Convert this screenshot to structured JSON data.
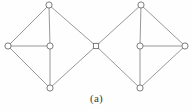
{
  "figure": {
    "caption": "(a)",
    "label": "two-diamond-graph",
    "colors": {
      "background": "#fefefe",
      "edge": "#8c8c8c",
      "node_stroke": "#6e6e6e",
      "node_fill": "#ffffff",
      "caption_text": "#3a3a3a"
    },
    "style": {
      "edge_width": 0.9,
      "node_radius": 3.1,
      "node_stroke_width": 0.9,
      "junction_size": 5.2
    }
  },
  "graph": {
    "type": "node-link-diagram",
    "description": "Two rhombus (diamond) subgraphs joined at a shared square articulation vertex",
    "nodes": [
      {
        "id": "L-top",
        "name": "left-top-node",
        "shape": "circle",
        "x": 49,
        "y": 5
      },
      {
        "id": "L-left",
        "name": "left-left-node",
        "shape": "circle",
        "x": 8,
        "y": 46
      },
      {
        "id": "L-center",
        "name": "left-center-node",
        "shape": "circle",
        "x": 50,
        "y": 46
      },
      {
        "id": "L-bottom",
        "name": "left-bottom-node",
        "shape": "circle",
        "x": 50,
        "y": 88
      },
      {
        "id": "J-center",
        "name": "shared-junction-node",
        "shape": "square",
        "x": 96,
        "y": 46
      },
      {
        "id": "R-top",
        "name": "right-top-node",
        "shape": "circle",
        "x": 141,
        "y": 5
      },
      {
        "id": "R-center",
        "name": "right-center-node",
        "shape": "circle",
        "x": 140,
        "y": 46
      },
      {
        "id": "R-bottom",
        "name": "right-bottom-node",
        "shape": "circle",
        "x": 140,
        "y": 88
      },
      {
        "id": "R-right",
        "name": "right-right-node",
        "shape": "circle",
        "x": 185,
        "y": 46
      }
    ],
    "edges": [
      {
        "from": "L-left",
        "to": "L-top",
        "name": "edge-left-left-to-left-top"
      },
      {
        "from": "L-left",
        "to": "L-center",
        "name": "edge-left-left-to-left-center"
      },
      {
        "from": "L-left",
        "to": "L-bottom",
        "name": "edge-left-left-to-left-bottom"
      },
      {
        "from": "L-top",
        "to": "L-center",
        "name": "edge-left-top-to-left-center"
      },
      {
        "from": "L-top",
        "to": "J-center",
        "name": "edge-left-top-to-junction"
      },
      {
        "from": "L-center",
        "to": "L-bottom",
        "name": "edge-left-center-to-left-bottom"
      },
      {
        "from": "L-bottom",
        "to": "J-center",
        "name": "edge-left-bottom-to-junction"
      },
      {
        "from": "J-center",
        "to": "R-top",
        "name": "edge-junction-to-right-top"
      },
      {
        "from": "J-center",
        "to": "R-bottom",
        "name": "edge-junction-to-right-bottom"
      },
      {
        "from": "R-top",
        "to": "R-center",
        "name": "edge-right-top-to-right-center"
      },
      {
        "from": "R-top",
        "to": "R-right",
        "name": "edge-right-top-to-right-right"
      },
      {
        "from": "R-center",
        "to": "R-bottom",
        "name": "edge-right-center-to-right-bottom"
      },
      {
        "from": "R-center",
        "to": "R-right",
        "name": "edge-right-center-to-right-right"
      },
      {
        "from": "R-bottom",
        "to": "R-right",
        "name": "edge-right-bottom-to-right-right"
      }
    ],
    "counts": {
      "node_count": 9,
      "edge_count": 14
    }
  }
}
